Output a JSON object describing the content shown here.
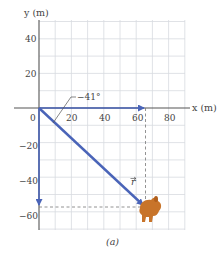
{
  "figure": {
    "caption": "(a)",
    "x_axis": {
      "label": "x (m)",
      "ticks": [
        {
          "value": 0,
          "label": "0"
        },
        {
          "value": 20,
          "label": "20"
        },
        {
          "value": 40,
          "label": "40"
        },
        {
          "value": 60,
          "label": "60"
        },
        {
          "value": 80,
          "label": "80"
        }
      ],
      "range": [
        0,
        90
      ],
      "grid_step": 10
    },
    "y_axis": {
      "label": "y (m)",
      "ticks": [
        {
          "value": 40,
          "label": "40"
        },
        {
          "value": 20,
          "label": "20"
        },
        {
          "value": -20,
          "label": "−20"
        },
        {
          "value": -40,
          "label": "−40"
        },
        {
          "value": -60,
          "label": "−60"
        }
      ],
      "range": [
        -70,
        50
      ],
      "grid_step": 10
    },
    "angle_label": "−41°",
    "vector_label": "r",
    "vectors": {
      "position_r": {
        "from": [
          0,
          0
        ],
        "to": [
          65,
          -57
        ]
      },
      "x_component": {
        "from": [
          0,
          0
        ],
        "to": [
          65,
          0
        ]
      },
      "y_component": {
        "from": [
          0,
          0
        ],
        "to": [
          0,
          -57
        ]
      }
    },
    "colors": {
      "vector": "#4a64b8",
      "grid": "#d6d8de",
      "axis": "#555555",
      "rabbit": "#c8742a"
    }
  }
}
